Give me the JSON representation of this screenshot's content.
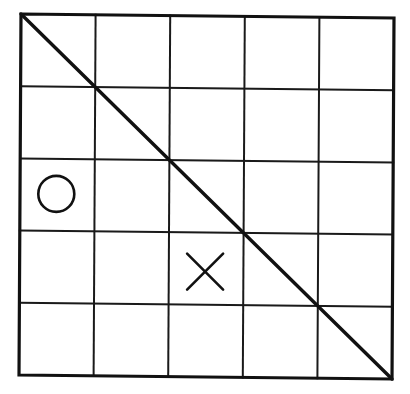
{
  "board": {
    "rows": 5,
    "cols": 5,
    "corners": {
      "top_left": [
        21,
        14
      ],
      "top_right": [
        394,
        18
      ],
      "bottom_left": [
        19,
        375
      ],
      "bottom_right": [
        392,
        379
      ]
    },
    "colors": {
      "line": "#111111",
      "background": "#ffffff"
    }
  },
  "diagonal": {
    "from": "top_left",
    "to": "bottom_right"
  },
  "marks": [
    {
      "type": "O",
      "row": 2,
      "col": 0,
      "label": "circle"
    },
    {
      "type": "X",
      "row": 3,
      "col": 2,
      "label": "cross"
    }
  ]
}
